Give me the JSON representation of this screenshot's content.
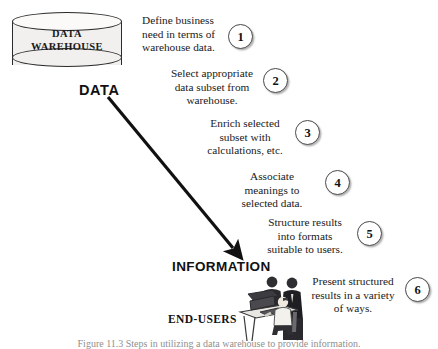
{
  "diagram": {
    "warehouse": {
      "label_line1": "DATA",
      "label_line2": "WAREHOUSE",
      "shape": "cylinder-icon"
    },
    "labels": {
      "data": "DATA",
      "information": "INFORMATION",
      "end_users": "END-USERS"
    },
    "arrow": {
      "name": "data-to-information-arrow",
      "from": "DATA",
      "to": "INFORMATION"
    },
    "steps": [
      {
        "number": "1",
        "text": "Define business\nneed in terms of\nwarehouse data."
      },
      {
        "number": "2",
        "text": "Select appropriate\ndata subset from\nwarehouse."
      },
      {
        "number": "3",
        "text": "Enrich selected\nsubset with\ncalculations, etc."
      },
      {
        "number": "4",
        "text": "Associate\nmeanings to\nselected data."
      },
      {
        "number": "5",
        "text": "Structure results\ninto formats\nsuitable to users."
      },
      {
        "number": "6",
        "text": "Present structured\nresults in a variety\nof ways."
      }
    ],
    "clipart": {
      "name": "end-users-at-computer-illustration"
    },
    "caption": "Figure 11.3  Steps in utilizing a data warehouse to provide information.",
    "colors": {
      "ink": "#1a1a1a",
      "cylinder_fill": "#f2f0ee",
      "outline": "#2b2b2b",
      "background": "#ffffff"
    }
  }
}
